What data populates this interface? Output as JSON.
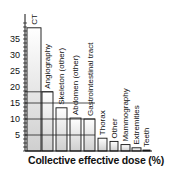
{
  "chart_data": {
    "type": "bar",
    "title": "",
    "xlabel": "Collective effective dose (%)",
    "ylabel": "",
    "ylim": [
      0,
      40
    ],
    "yticks": [
      5,
      10,
      15,
      20,
      25,
      30,
      35
    ],
    "grid": "horizontal grid lines at 5, 10, 15 spanning bars only",
    "legend": "none",
    "categories": [
      "CT",
      "Angiography",
      "Skeleton (other)",
      "Abdomen (other)",
      "Gastrointestinal tract",
      "Thorax",
      "Other",
      "Mammography",
      "Extremities",
      "Teeth"
    ],
    "values": [
      38.5,
      18.5,
      13.5,
      10.3,
      10.0,
      4.0,
      3.0,
      2.0,
      1.0,
      0.3
    ]
  },
  "colors": {
    "axis": "#111111",
    "bar_fill_top": "#ffffff",
    "bar_fill_bottom": "#cfcfcf",
    "bar_stroke": "#111111"
  }
}
